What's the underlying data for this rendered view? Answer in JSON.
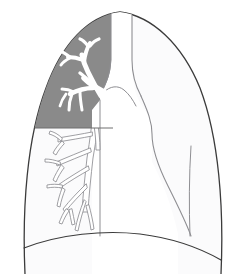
{
  "figure": {
    "type": "anatomical-illustration",
    "width": 246,
    "height": 274,
    "background_color": "#ffffff"
  },
  "colors": {
    "outline": "#3b3b3b",
    "shaded_lobe_fill": "#8a8a8a",
    "unshaded_lung_fill": "#fbfbfc",
    "mediastinum_fill": "#ffffff",
    "airway_fill": "#ffffff",
    "airway_stroke_shaded": "#ffffff",
    "airway_stroke_clear": "#8e8e92",
    "diaphragm_stroke": "#3b3b3b",
    "divider_stroke": "#6f6f6f"
  },
  "regions": [
    {
      "name": "shaded-upper-lobe",
      "label": "Shaded upper lobe region",
      "fill": "#8a8a8a",
      "description": "Gray opacified upper left zone above a horizontal boundary"
    },
    {
      "name": "clear-lung-field",
      "label": "Clear lung field",
      "fill": "#fbfbfc",
      "description": "Pale lung parenchyma below and lateral to shaded zone"
    },
    {
      "name": "mediastinum",
      "label": "Mediastinum and cardiac silhouette",
      "fill": "#ffffff",
      "description": "Central white column containing trachea and heart border"
    }
  ],
  "structures": [
    {
      "name": "thorax-outline",
      "label": "Thoracic outline"
    },
    {
      "name": "trachea",
      "label": "Trachea"
    },
    {
      "name": "carina",
      "label": "Carina"
    },
    {
      "name": "main-bronchus",
      "label": "Main bronchus"
    },
    {
      "name": "upper-lobe-bronchial-tree",
      "label": "Upper lobe bronchial tree"
    },
    {
      "name": "lower-lobe-bronchial-tree",
      "label": "Lower lobe bronchial tree"
    },
    {
      "name": "diaphragm",
      "label": "Diaphragm"
    },
    {
      "name": "horizontal-boundary",
      "label": "Shaded region lower boundary"
    },
    {
      "name": "cardiac-border",
      "label": "Cardiac border"
    },
    {
      "name": "lateral-fissure-line",
      "label": "Lateral vertical line"
    }
  ],
  "geometry": {
    "shade_boundary_y": 128,
    "apex_y": 12,
    "diaphragm_apex_y": 236,
    "trachea_left_x": 110,
    "trachea_right_x": 131,
    "carina_y": 96
  }
}
